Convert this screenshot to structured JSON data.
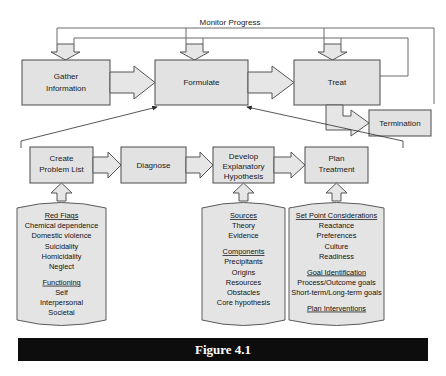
{
  "figure": {
    "caption": "Figure 4.1",
    "feedback_label": "Monitor Progress"
  },
  "top_row": {
    "boxes": [
      {
        "id": "gather",
        "label_line1": "Gather",
        "label_line2": "Information"
      },
      {
        "id": "formulate",
        "label_line1": "Formulate",
        "label_line2": ""
      },
      {
        "id": "treat",
        "label_line1": "Treat",
        "label_line2": ""
      },
      {
        "id": "termination",
        "label_line1": "Termination",
        "label_line2": ""
      }
    ]
  },
  "detail_row": {
    "boxes": [
      {
        "id": "create-problem-list",
        "line1": "Create",
        "line2": "Problem List",
        "line3": ""
      },
      {
        "id": "diagnose",
        "line1": "Diagnose",
        "line2": "",
        "line3": ""
      },
      {
        "id": "develop-explanatory-hypothesis",
        "line1": "Develop",
        "line2": "Explanatory",
        "line3": "Hypothesis"
      },
      {
        "id": "plan-treatment",
        "line1": "Plan",
        "line2": "Treatment",
        "line3": ""
      }
    ]
  },
  "scrolls": [
    {
      "id": "problem-list-scroll",
      "lines": [
        {
          "text": "Red Flags",
          "heading": true
        },
        {
          "text": "Chemical dependence",
          "heading": false
        },
        {
          "text": "Domestic violence",
          "heading": false
        },
        {
          "text": "Suicidality",
          "heading": false
        },
        {
          "text": "Homicidality",
          "heading": false
        },
        {
          "text": "Neglect",
          "heading": false
        },
        {
          "text": "",
          "heading": false
        },
        {
          "text": "Functioning",
          "heading": true
        },
        {
          "text": "Self",
          "heading": false
        },
        {
          "text": "Interpersonal",
          "heading": false
        },
        {
          "text": "Societal",
          "heading": false
        }
      ]
    },
    {
      "id": "hypothesis-scroll",
      "lines": [
        {
          "text": "Sources",
          "heading": true
        },
        {
          "text": "Theory",
          "heading": false
        },
        {
          "text": "Evidence",
          "heading": false
        },
        {
          "text": "",
          "heading": false
        },
        {
          "text": "Components",
          "heading": true
        },
        {
          "text": "Precipitants",
          "heading": false
        },
        {
          "text": "Origins",
          "heading": false
        },
        {
          "text": "Resources",
          "heading": false
        },
        {
          "text": "Obstacles",
          "heading": false
        },
        {
          "text": "Core hypothesis",
          "heading": false
        }
      ]
    },
    {
      "id": "plan-treatment-scroll",
      "lines": [
        {
          "text": "Set Point Considerations",
          "heading": true
        },
        {
          "text": "Reactance",
          "heading": false
        },
        {
          "text": "Preferences",
          "heading": false
        },
        {
          "text": "Culture",
          "heading": false
        },
        {
          "text": "Readiness",
          "heading": false
        },
        {
          "text": "",
          "heading": false
        },
        {
          "text": "Goal Identification",
          "heading": true
        },
        {
          "text": "Process/Outcome goals",
          "heading": false
        },
        {
          "text": "Short-term/Long-term goals",
          "heading": false
        },
        {
          "text": "",
          "heading": false
        },
        {
          "text": "Plan Interventions",
          "heading": true
        }
      ]
    }
  ],
  "colors": {
    "box_fill": "#e2e2e2",
    "box_stroke": "#4a4a4a",
    "arrow_fill": "#e6e6e6",
    "caption_bar": "#0d0d0d",
    "caption_text": "#ffffff"
  }
}
